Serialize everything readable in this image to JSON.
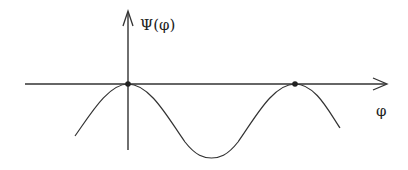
{
  "diagram": {
    "y_axis_label": "Ψ(φ)",
    "x_axis_label": "φ",
    "curve": "periodic cosine-like wave with maxima touching the horizontal axis",
    "marked_points": [
      {
        "name": "maximum-at-origin",
        "x_px": 128,
        "y_px": 84
      },
      {
        "name": "maximum-period",
        "x_px": 295,
        "y_px": 84
      }
    ],
    "colors": {
      "stroke": "#333333",
      "background": "#ffffff"
    }
  }
}
